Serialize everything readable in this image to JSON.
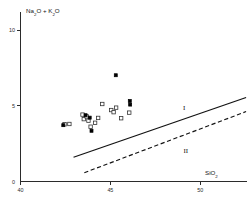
{
  "chart_data": {
    "type": "scatter",
    "title": "",
    "xlabel": "SiO2",
    "xlabel_display": "SiO",
    "xlabel_sub": "2",
    "ylabel": "Na2O + K2O",
    "ylabel_parts": {
      "na": "Na",
      "na_sub": "2",
      "o1": "O",
      "plus": " + ",
      "k": "K",
      "k_sub": "2",
      "o2": "O"
    },
    "xlim": [
      40,
      52.6
    ],
    "ylim": [
      0,
      11
    ],
    "xticks": [
      40,
      45,
      50
    ],
    "xtick_labels": [
      "40",
      "45",
      "50"
    ],
    "yticks": [
      0,
      5,
      10
    ],
    "ytick_labels": [
      "0",
      "5",
      "10"
    ],
    "grid": false,
    "legend": "none",
    "annotations": [
      {
        "text": "I",
        "x": 49.1,
        "y": 4.75,
        "name": "region-label-one"
      },
      {
        "text": "II",
        "x": 49.2,
        "y": 1.85,
        "name": "region-label-two"
      }
    ],
    "series": [
      {
        "name": "open-squares",
        "marker": "open-square",
        "points": [
          {
            "x": 42.45,
            "y": 3.78
          },
          {
            "x": 42.72,
            "y": 3.8
          },
          {
            "x": 43.45,
            "y": 4.42
          },
          {
            "x": 43.52,
            "y": 4.12
          },
          {
            "x": 43.68,
            "y": 4.3
          },
          {
            "x": 43.78,
            "y": 4.02
          },
          {
            "x": 43.9,
            "y": 3.62
          },
          {
            "x": 44.15,
            "y": 3.88
          },
          {
            "x": 44.32,
            "y": 4.2
          },
          {
            "x": 44.55,
            "y": 5.12
          },
          {
            "x": 45.05,
            "y": 4.72
          },
          {
            "x": 45.18,
            "y": 4.58
          },
          {
            "x": 45.32,
            "y": 4.88
          },
          {
            "x": 45.6,
            "y": 4.18
          },
          {
            "x": 46.05,
            "y": 4.55
          }
        ]
      },
      {
        "name": "filled-squares",
        "marker": "filled-square",
        "points": [
          {
            "x": 42.38,
            "y": 3.72
          },
          {
            "x": 43.62,
            "y": 4.38
          },
          {
            "x": 43.85,
            "y": 4.22
          },
          {
            "x": 43.95,
            "y": 3.35
          },
          {
            "x": 45.3,
            "y": 7.02
          },
          {
            "x": 46.08,
            "y": 5.32
          },
          {
            "x": 46.1,
            "y": 5.08
          }
        ]
      }
    ],
    "boundary_lines": [
      {
        "name": "upper-boundary-solid",
        "style": "solid",
        "x1": 42.95,
        "y1": 1.6,
        "x2": 52.55,
        "y2": 5.55
      },
      {
        "name": "lower-boundary-dashed",
        "style": "dashed",
        "x1": 43.55,
        "y1": 0.58,
        "x2": 52.55,
        "y2": 4.62
      }
    ]
  }
}
